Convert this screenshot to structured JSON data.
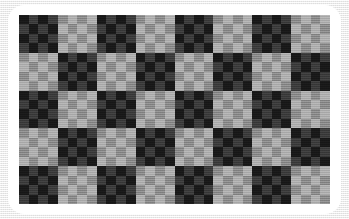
{
  "image": {
    "title": "Nested Checkerboard Pattern",
    "description": "An 8 by 5 checkerboard in which every square is itself subdivided into a 4 by 4 checkerboard, photographed as a white rounded card on a light gray textured surface."
  },
  "canvas": {
    "width": 349,
    "height": 219,
    "backdrop_color": "#f1f1f1"
  },
  "frame": {
    "name": "white-rounded-card",
    "color": "#ffffff",
    "left": 8,
    "top": 5,
    "width": 333,
    "height": 209,
    "corner_radius": 16
  },
  "board": {
    "left": 19,
    "top": 15,
    "width": 311,
    "height": 189,
    "major_columns": 8,
    "major_rows": 5,
    "sub_columns": 4,
    "sub_rows": 4,
    "top_left_major_is_dark": true,
    "top_left_sub_is_dark": true
  },
  "palette": {
    "dark_block_dark_square": "#191919",
    "dark_block_light_square": "#3d3d3d",
    "light_block_dark_square": "#8c8c8c",
    "light_block_light_square": "#b0b0b0"
  },
  "chart_data": {
    "type": "heatmap",
    "xlabel": "",
    "ylabel": "",
    "legend": [],
    "grid": false,
    "major_columns": 8,
    "major_rows": 5,
    "sub_columns": 4,
    "sub_rows": 4,
    "tone_levels": [
      "#191919",
      "#3d3d3d",
      "#8c8c8c",
      "#b0b0b0"
    ],
    "major_matrix": [
      [
        1,
        0,
        1,
        0,
        1,
        0,
        1,
        0
      ],
      [
        0,
        1,
        0,
        1,
        0,
        1,
        0,
        1
      ],
      [
        1,
        0,
        1,
        0,
        1,
        0,
        1,
        0
      ],
      [
        0,
        1,
        0,
        1,
        0,
        1,
        0,
        1
      ],
      [
        1,
        0,
        1,
        0,
        1,
        0,
        1,
        0
      ]
    ],
    "sub_matrix": [
      [
        1,
        0,
        1,
        0
      ],
      [
        0,
        1,
        0,
        1
      ],
      [
        1,
        0,
        1,
        0
      ],
      [
        0,
        1,
        0,
        1
      ]
    ]
  }
}
